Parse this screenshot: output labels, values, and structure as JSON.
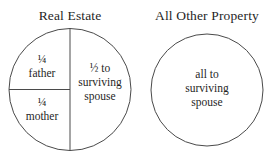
{
  "diagram": {
    "type": "pie-partition",
    "background_color": "#ffffff",
    "stroke_color": "#4a4a4a",
    "text_color": "#1f1f1f",
    "panels": [
      {
        "id": "real-estate",
        "title": "Real Estate",
        "shape": "circle",
        "divided": true,
        "segments": [
          {
            "id": "father",
            "share": "¼",
            "recipient": "father",
            "fraction_value": 0.25,
            "position": "upper-left-quadrant"
          },
          {
            "id": "mother",
            "share": "¼",
            "recipient": "mother",
            "fraction_value": 0.25,
            "position": "lower-left-quadrant"
          },
          {
            "id": "surviving-spouse-real-estate",
            "share_line1": "½ to",
            "share_line2": "surviving",
            "share_line3": "spouse",
            "fraction_value": 0.5,
            "position": "right-half"
          }
        ]
      },
      {
        "id": "all-other-property",
        "title": "All Other Property",
        "shape": "circle",
        "divided": false,
        "segments": [
          {
            "id": "surviving-spouse-other-property",
            "share_line1": "all to",
            "share_line2": "surviving",
            "share_line3": "spouse",
            "fraction_value": 1.0,
            "position": "whole"
          }
        ]
      }
    ]
  }
}
